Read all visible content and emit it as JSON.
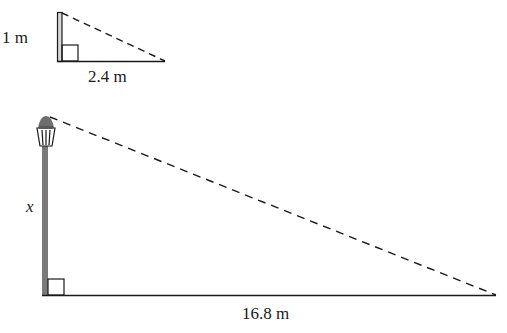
{
  "diagram": {
    "type": "similar-triangles-shadow",
    "small_triangle": {
      "height_label": "1 m",
      "base_label": "2.4 m",
      "object": "post"
    },
    "large_triangle": {
      "height_label": "x",
      "base_label": "16.8 m",
      "object": "lamp-post"
    },
    "colors": {
      "line": "#1a1a1a",
      "pole": "#7a7a7a",
      "lamp": "#6e6e6e"
    }
  }
}
